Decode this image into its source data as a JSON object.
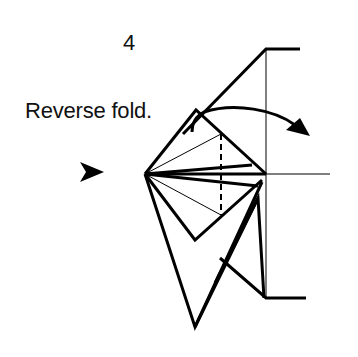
{
  "step": {
    "number": "4",
    "instruction": "Reverse fold."
  },
  "diagram": {
    "symbols": [
      "push-arrow",
      "fold-motion-arrow",
      "valley-fold-dashed-line"
    ],
    "colors": {
      "ink": "#000000",
      "background": "#ffffff"
    }
  }
}
